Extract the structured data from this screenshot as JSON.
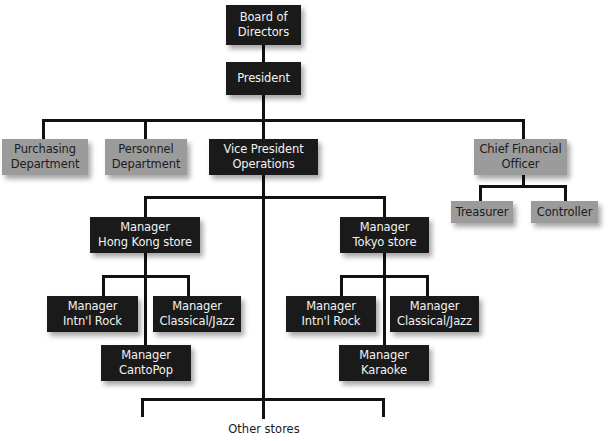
{
  "chart": {
    "board": {
      "line1": "Board of",
      "line2": "Directors"
    },
    "president": {
      "line1": "President"
    },
    "purchasing": {
      "line1": "Purchasing",
      "line2": "Department"
    },
    "personnel": {
      "line1": "Personnel",
      "line2": "Department"
    },
    "vp_operations": {
      "line1": "Vice President",
      "line2": "Operations"
    },
    "cfo": {
      "line1": "Chief Financial",
      "line2": "Officer"
    },
    "treasurer": {
      "line1": "Treasurer"
    },
    "controller": {
      "line1": "Controller"
    },
    "hk_manager": {
      "line1": "Manager",
      "line2": "Hong Kong store"
    },
    "tokyo_manager": {
      "line1": "Manager",
      "line2": "Tokyo store"
    },
    "hk_intl_rock": {
      "line1": "Manager",
      "line2": "Intn'l Rock"
    },
    "hk_classical_jazz": {
      "line1": "Manager",
      "line2": "Classical/Jazz"
    },
    "hk_cantopop": {
      "line1": "Manager",
      "line2": "CantoPop"
    },
    "tokyo_intl_rock": {
      "line1": "Manager",
      "line2": "Intn'l Rock"
    },
    "tokyo_classical_jazz": {
      "line1": "Manager",
      "line2": "Classical/Jazz"
    },
    "tokyo_karaoke": {
      "line1": "Manager",
      "line2": "Karaoke"
    },
    "other_stores": "Other stores"
  },
  "colors": {
    "dark_box": "#1a1a1a",
    "gray_box": "#9b9b9b",
    "line": "#111111"
  }
}
